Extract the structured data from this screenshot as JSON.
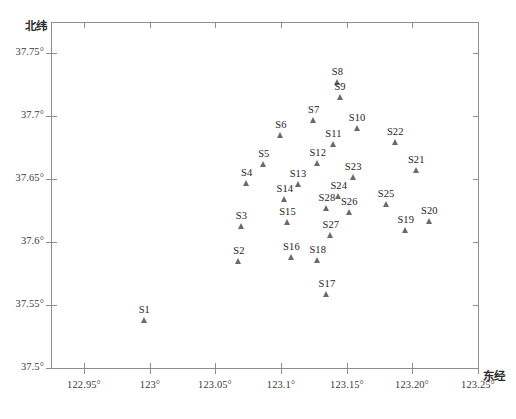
{
  "chart_data": {
    "type": "scatter",
    "title": "",
    "xlabel": "东经",
    "ylabel": "北纬",
    "xlim": [
      122.925,
      123.25
    ],
    "ylim": [
      37.5,
      37.775
    ],
    "grid": false,
    "legend": null,
    "xticks": [
      {
        "value": 122.95,
        "label": "122.95°"
      },
      {
        "value": 123.0,
        "label": "123°"
      },
      {
        "value": 123.05,
        "label": "123.05°"
      },
      {
        "value": 123.1,
        "label": "123.1°"
      },
      {
        "value": 123.15,
        "label": "123.15°"
      },
      {
        "value": 123.2,
        "label": "123.20°"
      },
      {
        "value": 123.25,
        "label": "123.25°"
      }
    ],
    "yticks": [
      {
        "value": 37.75,
        "label": "37.75°"
      },
      {
        "value": 37.7,
        "label": "37.7°"
      },
      {
        "value": 37.65,
        "label": "37.65°"
      },
      {
        "value": 37.6,
        "label": "37.6°"
      },
      {
        "value": 37.55,
        "label": "37.55°"
      },
      {
        "value": 37.5,
        "label": "37.5°"
      }
    ],
    "marker": "triangle-up",
    "marker_color": "#6a6a6a",
    "points": [
      {
        "label": "S1",
        "x": 122.996,
        "y": 37.538
      },
      {
        "label": "S2",
        "x": 123.068,
        "y": 37.585
      },
      {
        "label": "S3",
        "x": 123.07,
        "y": 37.613
      },
      {
        "label": "S4",
        "x": 123.074,
        "y": 37.647
      },
      {
        "label": "S5",
        "x": 123.087,
        "y": 37.662
      },
      {
        "label": "S6",
        "x": 123.1,
        "y": 37.685
      },
      {
        "label": "S7",
        "x": 123.125,
        "y": 37.697
      },
      {
        "label": "S8",
        "x": 123.143,
        "y": 37.727
      },
      {
        "label": "S9",
        "x": 123.145,
        "y": 37.715
      },
      {
        "label": "S10",
        "x": 123.158,
        "y": 37.691
      },
      {
        "label": "S11",
        "x": 123.14,
        "y": 37.678
      },
      {
        "label": "S12",
        "x": 123.128,
        "y": 37.663
      },
      {
        "label": "S13",
        "x": 123.113,
        "y": 37.646
      },
      {
        "label": "S14",
        "x": 123.103,
        "y": 37.634
      },
      {
        "label": "S15",
        "x": 123.105,
        "y": 37.616
      },
      {
        "label": "S16",
        "x": 123.108,
        "y": 37.588
      },
      {
        "label": "S17",
        "x": 123.135,
        "y": 37.559
      },
      {
        "label": "S18",
        "x": 123.128,
        "y": 37.586
      },
      {
        "label": "S19",
        "x": 123.195,
        "y": 37.61
      },
      {
        "label": "S20",
        "x": 123.213,
        "y": 37.617
      },
      {
        "label": "S21",
        "x": 123.203,
        "y": 37.657
      },
      {
        "label": "S22",
        "x": 123.187,
        "y": 37.68
      },
      {
        "label": "S23",
        "x": 123.155,
        "y": 37.652
      },
      {
        "label": "S24",
        "x": 123.144,
        "y": 37.637
      },
      {
        "label": "S25",
        "x": 123.18,
        "y": 37.63
      },
      {
        "label": "S26",
        "x": 123.152,
        "y": 37.624
      },
      {
        "label": "S27",
        "x": 123.138,
        "y": 37.606
      },
      {
        "label": "S28",
        "x": 123.135,
        "y": 37.627
      }
    ]
  }
}
